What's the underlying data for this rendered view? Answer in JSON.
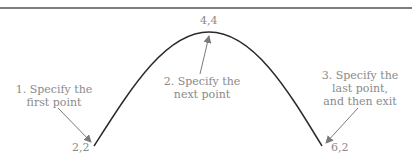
{
  "diagram": {
    "points": [
      {
        "label": "2,2",
        "x": 94,
        "y": 146
      },
      {
        "label": "4,4",
        "x": 209,
        "y": 32
      },
      {
        "label": "6,2",
        "x": 322,
        "y": 146
      }
    ],
    "steps": [
      {
        "line1": "1. Specify the",
        "line2": "first point"
      },
      {
        "line1": "2. Specify the",
        "line2": "next point"
      },
      {
        "line1": "3. Specify the",
        "line2": "last point,",
        "line3": "and then exit"
      }
    ],
    "colors": {
      "curve": "#2a2a2a",
      "annotation": "#8a8a8a",
      "rule": "#555555"
    }
  }
}
